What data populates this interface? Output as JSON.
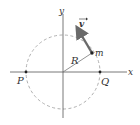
{
  "diagram": {
    "axes": {
      "x_label": "x",
      "y_label": "y"
    },
    "circle": {
      "radius_label": "R",
      "style": "dashed"
    },
    "particle": {
      "label": "m"
    },
    "velocity": {
      "label": "v",
      "has_arrow_accent": true
    },
    "points": [
      {
        "label": "P",
        "position": "left intersection of circle with x-axis"
      },
      {
        "label": "Q",
        "position": "right intersection of circle with x-axis"
      }
    ],
    "colors": {
      "axis": "#555555",
      "circle": "#b0b0b0",
      "radius": "#777777",
      "vector": "#6a6a6a",
      "point": "#222222",
      "text": "#333333"
    }
  }
}
